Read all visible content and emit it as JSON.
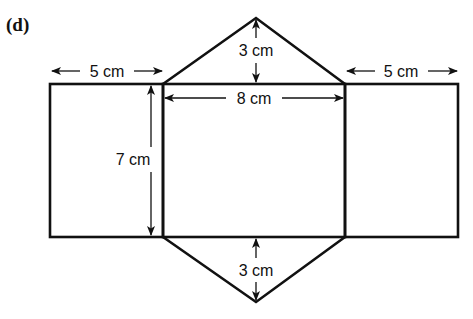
{
  "part_label": "(d)",
  "dimensions": {
    "left_width": "5 cm",
    "right_width": "5 cm",
    "middle_width": "8 cm",
    "height": "7 cm",
    "top_triangle_height": "3 cm",
    "bottom_triangle_height": "3 cm"
  },
  "colors": {
    "stroke": "#111111",
    "background": "#ffffff"
  }
}
